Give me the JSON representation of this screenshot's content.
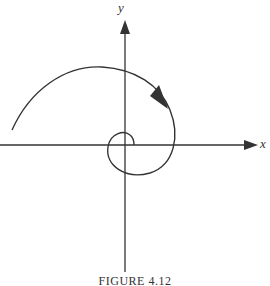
{
  "figure": {
    "caption": "FIGURE 4.12",
    "x_axis_label": "x",
    "y_axis_label": "y",
    "curve": "spiral-trajectory",
    "direction": "clockwise-inward",
    "colors": {
      "stroke": "#333333",
      "background": "#ffffff"
    }
  }
}
